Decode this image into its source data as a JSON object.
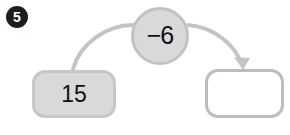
{
  "exercise": {
    "problem_number": "5",
    "input_value": "15",
    "operator_label": "−6",
    "answer_value": "",
    "colors": {
      "badge_fill": "#1d1d1d",
      "badge_text": "#ffffff",
      "node_fill": "#d9d9d9",
      "node_border": "#c2c2c2",
      "box_fill": "#d9d9d9",
      "box_border": "#c7c7c7",
      "answer_fill": "#ffffff",
      "answer_border": "#bdbdbd",
      "arrow": "#c4c4c4",
      "text": "#111111"
    },
    "icons": {
      "input_arrow": "curved-arrow-up-right-icon",
      "output_arrow": "curved-arrow-down-right-icon"
    }
  }
}
